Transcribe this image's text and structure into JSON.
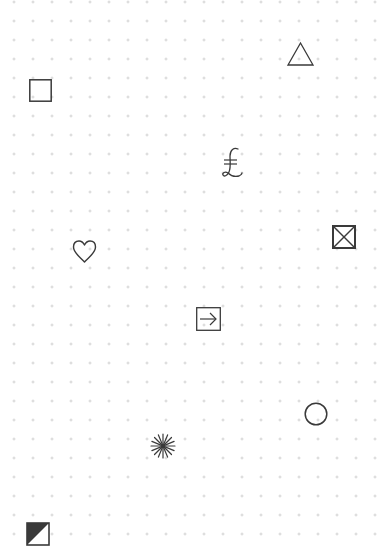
{
  "canvas": {
    "background": "#ffffff",
    "dot_color": "#c9c9c9",
    "ink_color": "#3a3a3a",
    "grid_spacing": 19
  },
  "symbols": [
    {
      "name": "triangle",
      "glyph": "△",
      "x": 287,
      "y": 42
    },
    {
      "name": "square",
      "glyph": "□",
      "x": 29,
      "y": 79
    },
    {
      "name": "lira",
      "glyph": "₤",
      "x": 219,
      "y": 146
    },
    {
      "name": "squared-saltire",
      "glyph": "⊠",
      "x": 332,
      "y": 225
    },
    {
      "name": "heart",
      "glyph": "♡",
      "x": 72,
      "y": 240
    },
    {
      "name": "boxed-arrow",
      "glyph": "⇥",
      "x": 196,
      "y": 307
    },
    {
      "name": "circle",
      "glyph": "○",
      "x": 304,
      "y": 402
    },
    {
      "name": "asterisk",
      "glyph": "✳",
      "x": 150,
      "y": 433
    },
    {
      "name": "half-shaded-square",
      "glyph": "◩",
      "x": 26,
      "y": 522
    }
  ]
}
